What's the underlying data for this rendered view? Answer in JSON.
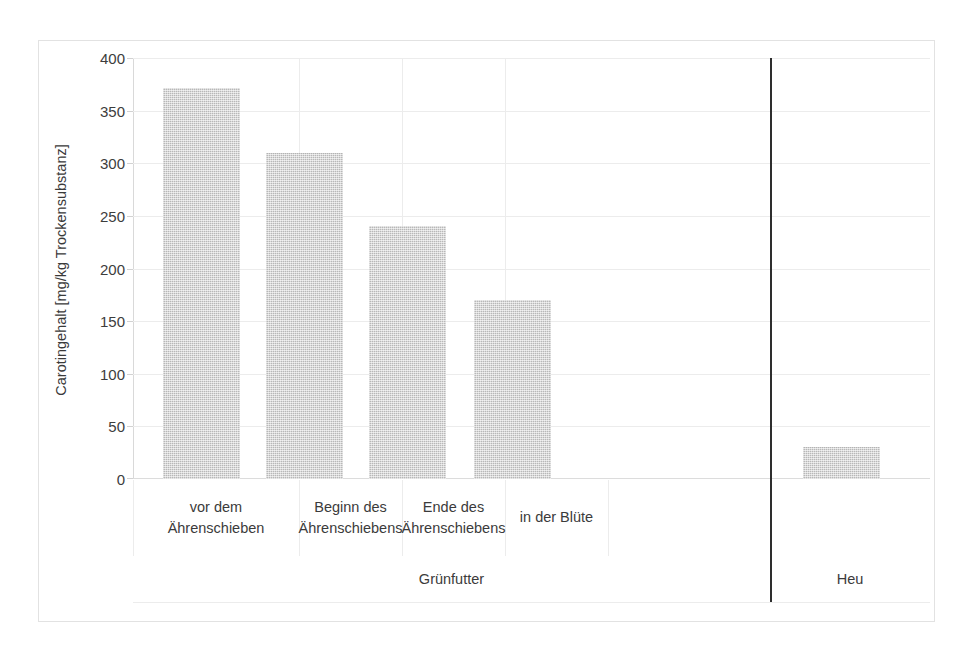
{
  "chart_data": {
    "type": "bar",
    "title": "",
    "subtitle": "",
    "xlabel": "",
    "ylabel": "Carotingehalt [mg/kg Trockensubstanz]",
    "categories": [
      "vor dem Ährenschieben",
      "Beginn des Ährenschiebens",
      "Ende des Ährenschiebens",
      "in der Blüte",
      ""
    ],
    "category_lines": [
      [
        "vor dem",
        "Ährenschieben"
      ],
      [
        "Beginn des",
        "Ährenschiebens"
      ],
      [
        "Ende des",
        "Ährenschiebens"
      ],
      [
        "in der Blüte",
        ""
      ],
      [
        "",
        ""
      ]
    ],
    "values": [
      372,
      310,
      240,
      170,
      30
    ],
    "ylim": [
      0,
      400
    ],
    "ytick_values": [
      0,
      50,
      100,
      150,
      200,
      250,
      300,
      350,
      400
    ],
    "ytick_labels": [
      "0",
      "50",
      "100",
      "150",
      "200",
      "250",
      "300",
      "350",
      "400"
    ],
    "grid": true,
    "legend": false,
    "legend_position": "none",
    "bar_color": "#c9c9c9",
    "groups": [
      {
        "label": "Grünfutter",
        "categories": [
          0,
          1,
          2,
          3
        ]
      },
      {
        "label": "Heu",
        "categories": [
          4
        ]
      }
    ],
    "group_separator_color": "#2e2e2e"
  },
  "axis": {
    "y_title": "Carotingehalt [mg/kg Trockensubstanz]"
  },
  "groups": {
    "gruenfutter": "Grünfutter",
    "heu": "Heu"
  }
}
